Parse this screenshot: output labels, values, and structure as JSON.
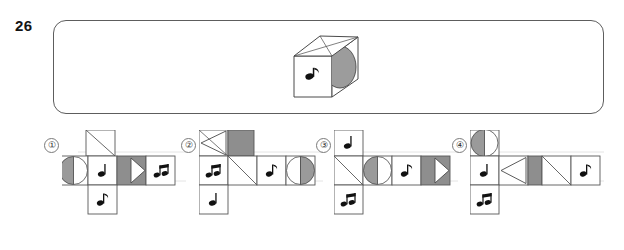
{
  "question": {
    "number": "26",
    "type": "cube-net-matching"
  },
  "stimulus": {
    "name": "cube-figure",
    "cube": {
      "top_face": {
        "pattern": "diagonal-lines",
        "fill": "white"
      },
      "front_face": {
        "symbol": "eighth-note",
        "glyph": "♪",
        "fill": "white"
      },
      "right_face": {
        "symbol": "half-circle",
        "fill": "gray",
        "fill_color": "#9c9c9c"
      }
    }
  },
  "colors": {
    "line": "#4a4a4a",
    "gray_fill": "#9a9a9a",
    "dark_gray_fill": "#8e8e8e",
    "grid_light": "#c9c9c9",
    "white": "#ffffff",
    "text": "#1a1a1a"
  },
  "glyphs": {
    "quarter_note": "♩",
    "eighth_note": "♪",
    "beamed_notes": "♫"
  },
  "options": [
    {
      "label": "①",
      "name": "option-1",
      "cells": [
        {
          "row": 0,
          "col": 1,
          "type": "diagonal-tl-br"
        },
        {
          "row": 1,
          "col": 0,
          "type": "circle-left-gray"
        },
        {
          "row": 1,
          "col": 1,
          "type": "note",
          "glyph": "♩"
        },
        {
          "row": 1,
          "col": 2,
          "type": "gray-square-with-triangle-right"
        },
        {
          "row": 1,
          "col": 3,
          "type": "note",
          "glyph": "♫"
        },
        {
          "row": 2,
          "col": 1,
          "type": "note",
          "glyph": "♪"
        }
      ]
    },
    {
      "label": "②",
      "name": "option-2",
      "cells": [
        {
          "row": 0,
          "col": 0,
          "type": "triangle-left"
        },
        {
          "row": 0,
          "col": 1,
          "type": "gray-square"
        },
        {
          "row": 1,
          "col": 0,
          "type": "note",
          "glyph": "♫"
        },
        {
          "row": 1,
          "col": 1,
          "type": "diagonal-tl-br"
        },
        {
          "row": 1,
          "col": 2,
          "type": "note",
          "glyph": "♪"
        },
        {
          "row": 1,
          "col": 3,
          "type": "circle-right-gray"
        },
        {
          "row": 2,
          "col": 0,
          "type": "note",
          "glyph": "♩"
        }
      ]
    },
    {
      "label": "③",
      "name": "option-3",
      "cells": [
        {
          "row": 0,
          "col": 0,
          "type": "note",
          "glyph": "♩"
        },
        {
          "row": 1,
          "col": 0,
          "type": "diagonal-tr-bl"
        },
        {
          "row": 1,
          "col": 1,
          "type": "circle-left-gray"
        },
        {
          "row": 1,
          "col": 2,
          "type": "note",
          "glyph": "♪"
        },
        {
          "row": 1,
          "col": 3,
          "type": "gray-square-with-triangle-right"
        },
        {
          "row": 2,
          "col": 0,
          "type": "note",
          "glyph": "♫"
        }
      ]
    },
    {
      "label": "④",
      "name": "option-4",
      "cells": [
        {
          "row": 0,
          "col": 0,
          "type": "circle-left-gray"
        },
        {
          "row": 1,
          "col": 0,
          "type": "note",
          "glyph": "♩"
        },
        {
          "row": 1,
          "col": 1,
          "type": "triangle-left"
        },
        {
          "row": 1,
          "col": 2,
          "type": "gray-square"
        },
        {
          "row": 1,
          "col": 3,
          "type": "diagonal-tr-bl"
        },
        {
          "row": 1,
          "col": 4,
          "type": "note",
          "glyph": "♪"
        },
        {
          "row": 2,
          "col": 0,
          "type": "note",
          "glyph": "♫"
        }
      ]
    }
  ]
}
